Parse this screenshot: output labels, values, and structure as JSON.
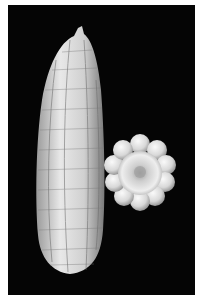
{
  "image": {
    "subject": "white corn ear and cross-section on black background",
    "colors": {
      "background": "#050505",
      "border": "#ffffff",
      "kernel": "#e6e6e6",
      "kernel_shadow": "#8a8a8a"
    }
  }
}
